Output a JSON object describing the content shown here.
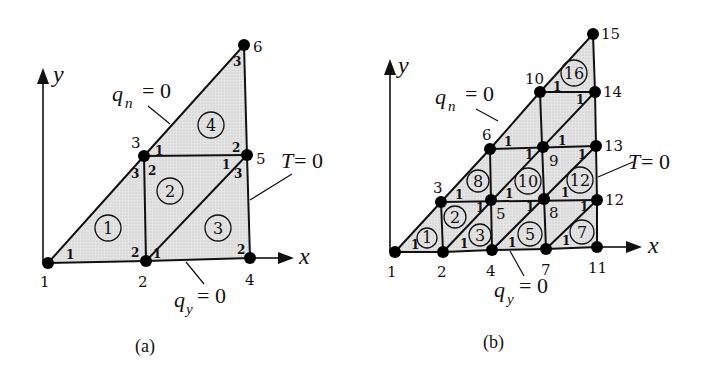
{
  "figure": {
    "panels": [
      {
        "id": "a",
        "caption": "(a)",
        "axes": {
          "x_label": "x",
          "y_label": "y"
        },
        "boundary_conditions": [
          {
            "symbol": "q",
            "subscript": "n",
            "rhs": "= 0"
          },
          {
            "symbol": "q",
            "subscript": "y",
            "rhs": "= 0"
          },
          {
            "symbol": "T",
            "rhs": "= 0"
          }
        ],
        "nodes": [
          {
            "id": "1",
            "x": 48,
            "y": 263
          },
          {
            "id": "2",
            "x": 146,
            "y": 261
          },
          {
            "id": "3",
            "x": 144,
            "y": 156
          },
          {
            "id": "4",
            "x": 250,
            "y": 258
          },
          {
            "id": "5",
            "x": 247,
            "y": 155
          },
          {
            "id": "6",
            "x": 244,
            "y": 45
          }
        ],
        "elements": [
          {
            "id": "1",
            "nodes": [
              "1",
              "2",
              "3"
            ]
          },
          {
            "id": "2",
            "nodes": [
              "2",
              "5",
              "3"
            ]
          },
          {
            "id": "3",
            "nodes": [
              "2",
              "4",
              "5"
            ]
          },
          {
            "id": "4",
            "nodes": [
              "3",
              "5",
              "6"
            ]
          }
        ],
        "local_numbers": [
          "1",
          "2",
          "3"
        ]
      },
      {
        "id": "b",
        "caption": "(b)",
        "axes": {
          "x_label": "x",
          "y_label": "y"
        },
        "boundary_conditions": [
          {
            "symbol": "q",
            "subscript": "n",
            "rhs": "= 0"
          },
          {
            "symbol": "q",
            "subscript": "y",
            "rhs": "= 0"
          },
          {
            "symbol": "T",
            "rhs": "= 0"
          }
        ],
        "nodes": [
          {
            "id": "1",
            "x": 395,
            "y": 252
          },
          {
            "id": "2",
            "x": 443,
            "y": 252
          },
          {
            "id": "3",
            "x": 441,
            "y": 202
          },
          {
            "id": "4",
            "x": 492,
            "y": 250
          },
          {
            "id": "5",
            "x": 491,
            "y": 200
          },
          {
            "id": "6",
            "x": 490,
            "y": 149
          },
          {
            "id": "7",
            "x": 546,
            "y": 249
          },
          {
            "id": "8",
            "x": 544,
            "y": 199
          },
          {
            "id": "9",
            "x": 543,
            "y": 147
          },
          {
            "id": "10",
            "x": 540,
            "y": 92
          },
          {
            "id": "11",
            "x": 597,
            "y": 247
          },
          {
            "id": "12",
            "x": 597,
            "y": 200
          },
          {
            "id": "13",
            "x": 596,
            "y": 146
          },
          {
            "id": "14",
            "x": 595,
            "y": 92
          },
          {
            "id": "15",
            "x": 593,
            "y": 34
          }
        ],
        "element_labels": [
          "1",
          "2",
          "3",
          "5",
          "7",
          "8",
          "10",
          "12",
          "16"
        ],
        "local_numbers": [
          "1"
        ]
      }
    ]
  }
}
